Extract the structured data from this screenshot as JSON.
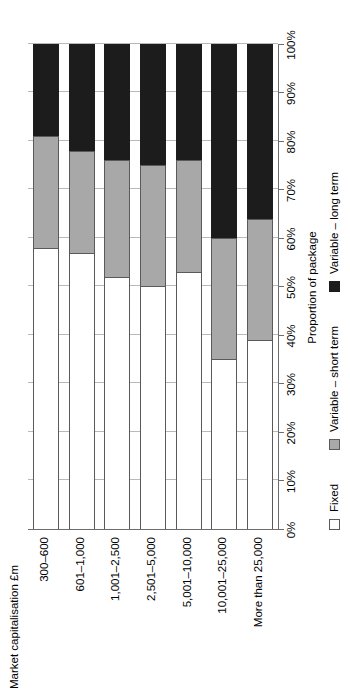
{
  "chart_data": {
    "type": "bar",
    "stacked": true,
    "orientation": "horizontal",
    "title": "",
    "xlabel": "Proportion of package",
    "ylabel": "Market capitalisation £m",
    "xlim": [
      0,
      100
    ],
    "grid": true,
    "legend_position": "bottom-left",
    "xtick_labels": [
      "0%",
      "10%",
      "20%",
      "30%",
      "40%",
      "50%",
      "60%",
      "70%",
      "80%",
      "90%",
      "100%"
    ],
    "xtick_values": [
      0,
      10,
      20,
      30,
      40,
      50,
      60,
      70,
      80,
      90,
      100
    ],
    "categories": [
      "300–600",
      "601–1,000",
      "1,001–2,500",
      "2,501–5,000",
      "5,001–10,000",
      "10,001–25,000",
      "More than 25,000"
    ],
    "series": [
      {
        "name": "Fixed",
        "color": "#ffffff",
        "values": [
          58,
          57,
          52,
          50,
          53,
          35,
          39
        ]
      },
      {
        "name": "Variable – short term",
        "color": "#a8a8a8",
        "values": [
          23,
          21,
          24,
          25,
          23,
          25,
          25
        ]
      },
      {
        "name": "Variable – long term",
        "color": "#1c1c1c",
        "values": [
          19,
          22,
          24,
          25,
          24,
          40,
          36
        ]
      }
    ]
  },
  "legend": {
    "items": [
      {
        "label": "Fixed",
        "swatch": "legend-swatch-fixed"
      },
      {
        "label": "Variable – short term",
        "swatch": "legend-swatch-variable-short-term"
      },
      {
        "label": "Variable – long term",
        "swatch": "legend-swatch-variable-long-term"
      }
    ]
  }
}
